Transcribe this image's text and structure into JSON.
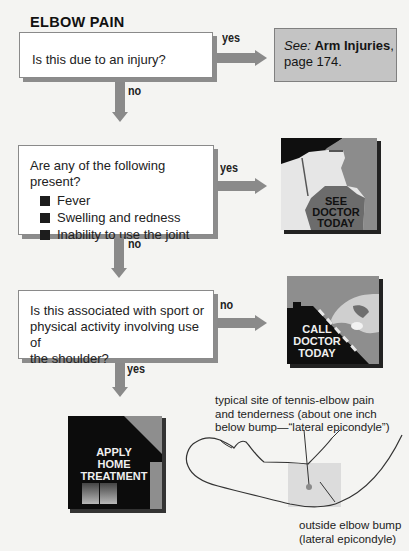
{
  "title": "ELBOW PAIN",
  "questions": [
    {
      "text": "Is this due to an injury?",
      "yes_label": "yes",
      "no_label": "no"
    },
    {
      "text": "Are any of the following present?",
      "bullets": [
        "Fever",
        "Swelling and redness",
        "Inability to use the joint"
      ],
      "yes_label": "yes",
      "no_label": "no"
    },
    {
      "text_lines": [
        "Is this associated with sport or",
        "physical activity involving use of",
        "the shoulder?"
      ],
      "no_label": "no",
      "yes_label": "yes"
    }
  ],
  "see_box": {
    "prefix": "See:",
    "link_text": "Arm Injuries",
    "comma": ",",
    "page": "page 174."
  },
  "outcomes": {
    "see_doctor": [
      "SEE",
      "DOCTOR",
      "TODAY"
    ],
    "call_doctor": [
      "CALL",
      "DOCTOR",
      "TODAY"
    ],
    "home_treatment": [
      "APPLY",
      "HOME",
      "TREATMENT"
    ]
  },
  "illustration": {
    "caption_top": [
      "typical site of tennis-elbow pain",
      "and tenderness (about one inch",
      "below bump—“lateral epicondyle”)"
    ],
    "caption_bottom": [
      "outside elbow bump",
      "(lateral epicondyle)"
    ]
  },
  "colors": {
    "arrow": "#8a8a8a",
    "box_shadow": "#8c8c8c",
    "see_box_bg": "#c4c4c4",
    "icon_dark": "#111111",
    "icon_gray": "#8e8e8e",
    "highlight_square": "#dcdcdc"
  }
}
